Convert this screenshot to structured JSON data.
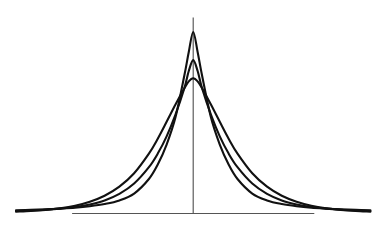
{
  "figure": {
    "title": "",
    "caption": "",
    "background_color": "#ffffff",
    "curve_color": "#111111",
    "axis_color": "#555555"
  },
  "chart_data": {
    "type": "line",
    "title": "",
    "subtitle": "",
    "xlabel": "",
    "ylabel": "",
    "xlim": [
      -6,
      6
    ],
    "ylim": [
      0,
      1
    ],
    "grid": false,
    "legend": null,
    "legend_position": "none",
    "tick_labels_x": [],
    "tick_labels_y": [],
    "annotations": [],
    "axes": {
      "vertical_axis": {
        "x": 0,
        "y_from": 0,
        "y_to": 1.08,
        "drawn": true
      },
      "horizontal_axis": {
        "y": 0,
        "x_from": -4.1,
        "x_to": 4.1,
        "drawn": true
      }
    },
    "x": [
      -6.0,
      -5.5,
      -5.0,
      -4.5,
      -4.0,
      -3.5,
      -3.0,
      -2.5,
      -2.0,
      -1.5,
      -1.2,
      -0.9,
      -0.6,
      -0.3,
      -0.15,
      0.0,
      0.15,
      0.3,
      0.6,
      0.9,
      1.2,
      1.5,
      2.0,
      2.5,
      3.0,
      3.5,
      4.0,
      4.5,
      5.0,
      5.5,
      6.0
    ],
    "series": [
      {
        "name": "curve-tall-narrow",
        "peak_value": 1.0,
        "peak_x": 0.0,
        "values": [
          0.018,
          0.02,
          0.023,
          0.027,
          0.032,
          0.04,
          0.052,
          0.072,
          0.11,
          0.19,
          0.27,
          0.38,
          0.53,
          0.76,
          0.89,
          1.0,
          0.89,
          0.76,
          0.53,
          0.38,
          0.27,
          0.19,
          0.11,
          0.072,
          0.052,
          0.04,
          0.032,
          0.027,
          0.023,
          0.02,
          0.018
        ]
      },
      {
        "name": "curve-medium",
        "peak_value": 0.845,
        "peak_x": 0.0,
        "values": [
          0.014,
          0.017,
          0.021,
          0.027,
          0.036,
          0.05,
          0.072,
          0.108,
          0.165,
          0.255,
          0.33,
          0.425,
          0.545,
          0.69,
          0.785,
          0.845,
          0.785,
          0.69,
          0.545,
          0.425,
          0.33,
          0.255,
          0.165,
          0.108,
          0.072,
          0.05,
          0.036,
          0.027,
          0.021,
          0.017,
          0.014
        ]
      },
      {
        "name": "curve-flat-wide",
        "peak_value": 0.745,
        "peak_x": 0.0,
        "values": [
          0.01,
          0.014,
          0.02,
          0.029,
          0.043,
          0.065,
          0.098,
          0.148,
          0.222,
          0.33,
          0.412,
          0.505,
          0.6,
          0.69,
          0.728,
          0.745,
          0.728,
          0.69,
          0.6,
          0.505,
          0.412,
          0.33,
          0.222,
          0.148,
          0.098,
          0.065,
          0.043,
          0.029,
          0.02,
          0.014,
          0.01
        ]
      }
    ]
  }
}
